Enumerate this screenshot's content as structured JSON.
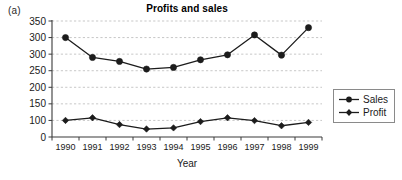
{
  "figure": {
    "panel_label": "(a)"
  },
  "legend": {
    "position": "right",
    "entries": [
      {
        "label": "Sales",
        "marker": "circle-marker-icon",
        "color": "#1c1c1c"
      },
      {
        "label": "Profit",
        "marker": "diamond-marker-icon",
        "color": "#1c1c1c"
      }
    ]
  },
  "chart_data": {
    "type": "line",
    "title": "Profits and sales",
    "xlabel": "Year",
    "ylabel": "",
    "x": [
      1990,
      1991,
      1992,
      1993,
      1994,
      1995,
      1996,
      1997,
      1998,
      1999
    ],
    "categories": [
      "1990",
      "1991",
      "1992",
      "1993",
      "1994",
      "1995",
      "1996",
      "1997",
      "1998",
      "1999"
    ],
    "ytick_labels": [
      "350",
      "300",
      "300",
      "250",
      "200",
      "150",
      "100",
      "0"
    ],
    "ylim": [
      0,
      350
    ],
    "grid": true,
    "legend_position": "right",
    "series": [
      {
        "name": "Sales",
        "marker": "circle",
        "color": "#1c1c1c",
        "values": [
          300,
          290,
          278,
          255,
          260,
          283,
          298,
          308,
          297,
          330
        ]
      },
      {
        "name": "Profit",
        "marker": "diamond",
        "color": "#1c1c1c",
        "values": [
          100,
          108,
          75,
          48,
          55,
          93,
          108,
          99,
          68,
          88
        ]
      }
    ]
  }
}
